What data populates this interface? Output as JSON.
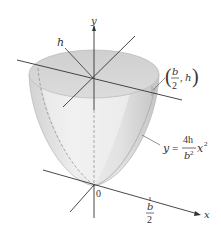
{
  "figure": {
    "type": "paraboloid-of-revolution",
    "axis_labels": {
      "y": "y",
      "x": "x",
      "h": "h",
      "origin": "0"
    },
    "point_label": {
      "open": "(",
      "num": "b",
      "den": "2",
      "sep": ",",
      "h": "h",
      "close": ")"
    },
    "tick_label": {
      "num": "b",
      "den": "2"
    },
    "equation": {
      "lhs": "y",
      "eq": "=",
      "num": "4h",
      "den": "b",
      "den_exp": "2",
      "var": "x",
      "var_exp": "2"
    },
    "colors": {
      "surface": "#d6d6d6",
      "surface_light": "#ececec",
      "rim": "#c8c8c8",
      "line": "#333333"
    }
  }
}
